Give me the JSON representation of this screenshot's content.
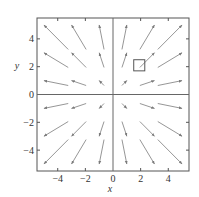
{
  "chart_data": {
    "type": "vector_field",
    "title": "",
    "xlabel": "x",
    "ylabel": "y",
    "xlim": [
      -5.5,
      5.5
    ],
    "ylim": [
      -5.5,
      5.5
    ],
    "grid": false,
    "axes_through_origin": true,
    "x_ticks": [
      -4,
      -2,
      0,
      2,
      4
    ],
    "y_ticks": [
      -4,
      -2,
      0,
      2,
      4
    ],
    "x_tick_labels": [
      "−4",
      "−2",
      "0",
      "2",
      "4"
    ],
    "y_tick_labels": [
      "−4",
      "−2",
      "0",
      "2",
      "4"
    ],
    "field": "F(x, y) = (x, y) radial outward",
    "arrow_grid_x": [
      -5,
      -3,
      -1,
      1,
      3,
      5
    ],
    "arrow_grid_y": [
      -5,
      -3,
      -1,
      1,
      3,
      5
    ],
    "arrow_scale": 0.32,
    "marker": {
      "shape": "square",
      "x": 1.9,
      "y": 2.1,
      "size_units": 0.8
    },
    "colors": {
      "frame": "#555555",
      "axes": "#666666",
      "arrows": "#8a8a8a",
      "marker": "#555555",
      "text": "#333333"
    }
  }
}
